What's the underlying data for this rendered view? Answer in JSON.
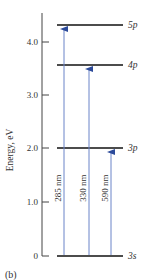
{
  "figure": {
    "caption": "(b)",
    "axis_title": "Energy, eV",
    "ticks": [
      {
        "label": "4.0",
        "value": 4.0
      },
      {
        "label": "3.0",
        "value": 3.0
      },
      {
        "label": "2.0",
        "value": 2.0
      },
      {
        "label": "1.0",
        "value": 1.0
      },
      {
        "label": "0",
        "value": 0
      }
    ],
    "levels": [
      {
        "label": "5p",
        "energy": 4.34
      },
      {
        "label": "4p",
        "energy": 3.6
      },
      {
        "label": "3p",
        "energy": 2.0
      },
      {
        "label": "3s",
        "energy": 0
      }
    ],
    "transitions": [
      {
        "label": "285 nm",
        "from": "3s",
        "to": "5p"
      },
      {
        "label": "330 nm",
        "from": "3s",
        "to": "4p"
      },
      {
        "label": "590 nm",
        "from": "3s",
        "to": "3p"
      }
    ],
    "colors": {
      "arrow": "#3b5fb0",
      "level": "#111111",
      "axis": "#444444"
    }
  }
}
